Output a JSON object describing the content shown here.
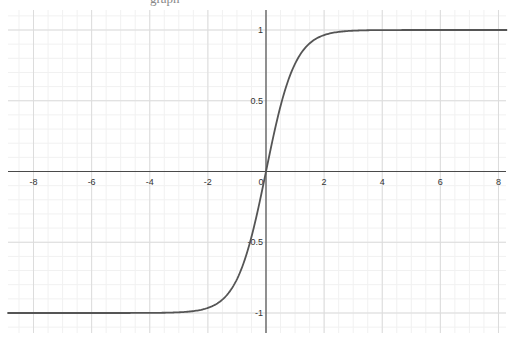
{
  "header": {
    "cut_off_text": "graph"
  },
  "colors": {
    "background": "#ffffff",
    "minor_grid": "#f1f1f1",
    "major_grid": "#dcdcdc",
    "axis": "#4a4a4a",
    "curve": "#555555",
    "label": "#333333"
  },
  "viewport": {
    "origin_px": [
      266,
      171.5
    ],
    "unit_x_px": 29.06,
    "unit_y_px": 141.5,
    "x_axis_px_range": [
      8,
      506
    ],
    "y_axis_px_range": [
      10,
      333
    ]
  },
  "chart_data": {
    "type": "line",
    "title": "",
    "xlabel": "",
    "ylabel": "",
    "function": "y = tanh(x)",
    "xlim": [
      -8.9,
      8.3
    ],
    "ylim": [
      -1.15,
      1.15
    ],
    "grid": true,
    "legend": null,
    "x_ticks": [
      -8,
      -6,
      -4,
      -2,
      0,
      2,
      4,
      6,
      8
    ],
    "x_tick_labels": [
      "-8",
      "-6",
      "-4",
      "-2",
      "0",
      "2",
      "4",
      "6",
      "8"
    ],
    "y_ticks": [
      -1,
      -0.5,
      0.5,
      1
    ],
    "y_tick_labels": [
      "-1",
      "-0.5",
      "0.5",
      "1"
    ],
    "x_minor_step": 0.5,
    "y_minor_step": 0.1,
    "series": [
      {
        "name": "tanh(x)",
        "x": [
          -8.9,
          -4,
          -3,
          -2.5,
          -2,
          -1.5,
          -1,
          -0.5,
          0,
          0.5,
          1,
          1.5,
          2,
          2.5,
          3,
          4,
          8.3
        ],
        "y": [
          -1.0,
          -0.9993,
          -0.9951,
          -0.9866,
          -0.964,
          -0.9051,
          -0.7616,
          -0.4621,
          0,
          0.4621,
          0.7616,
          0.9051,
          0.964,
          0.9866,
          0.9951,
          0.9993,
          1.0
        ]
      }
    ]
  }
}
